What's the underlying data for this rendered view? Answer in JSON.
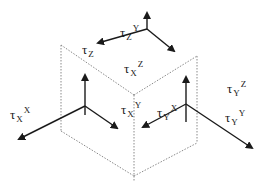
{
  "diagram": {
    "colors": {
      "line": "#1a1a1a",
      "dotted_edge": "#8a8a8a",
      "background": "#ffffff"
    },
    "faces": [
      {
        "name": "X",
        "position": "left"
      },
      {
        "name": "Y",
        "position": "right"
      },
      {
        "name": "Z",
        "position": "top"
      }
    ],
    "labels": {
      "tau_x_x": {
        "symbol": "τ",
        "sub": "X",
        "sup": "X"
      },
      "tau_x_y": {
        "symbol": "τ",
        "sub": "X",
        "sup": "Y"
      },
      "tau_x_z": {
        "symbol": "τ",
        "sub": "X",
        "sup": "Z"
      },
      "tau_y_x": {
        "symbol": "τ",
        "sub": "Y",
        "sup": "X"
      },
      "tau_y_y": {
        "symbol": "τ",
        "sub": "Y",
        "sup": "Y"
      },
      "tau_y_z": {
        "symbol": "τ",
        "sub": "Y",
        "sup": "Z"
      },
      "tau_z_x": {
        "symbol": "τ",
        "sub": "Z",
        "sup": "X"
      },
      "tau_z_y": {
        "symbol": "τ",
        "sub": "Z",
        "sup": "Y"
      },
      "tau_z_z": {
        "symbol": "τ",
        "sub": "Z",
        "sup": ""
      }
    }
  }
}
